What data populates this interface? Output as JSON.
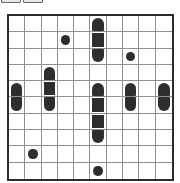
{
  "app": {
    "title": "Battleships Puzzle Grid"
  },
  "toolbar": {
    "buttons": [
      {
        "name": "toolbar-button-1",
        "label": ""
      },
      {
        "name": "toolbar-button-2",
        "label": ""
      }
    ]
  },
  "grid": {
    "columns": 10,
    "rows": 10,
    "border_color": "#2b2b2b",
    "line_color": "#8f8f8f",
    "piece_color": "#2e2e2e",
    "background": "#ffffff",
    "piece_types": {
      "empty": "empty-cell",
      "middle": "ship-middle-square",
      "end-top": "ship-end-rounded-top",
      "end-bottom": "ship-end-rounded-bottom",
      "end-left": "ship-end-rounded-left",
      "end-right": "ship-end-rounded-right",
      "sub": "submarine-circle",
      "water": "water-dot"
    },
    "cells": [
      [
        "",
        "",
        "",
        "",
        "",
        "end-top",
        "",
        "",
        "",
        ""
      ],
      [
        "",
        "",
        "",
        "sub",
        "",
        "middle",
        "",
        "",
        "",
        ""
      ],
      [
        "",
        "",
        "",
        "",
        "",
        "end-bottom",
        "",
        "sub",
        "",
        ""
      ],
      [
        "",
        "",
        "end-top",
        "",
        "",
        "",
        "",
        "",
        "",
        ""
      ],
      [
        "end-top",
        "",
        "middle",
        "",
        "",
        "end-top",
        "",
        "end-top",
        "",
        "end-top"
      ],
      [
        "end-bottom",
        "",
        "end-bottom",
        "",
        "",
        "middle",
        "",
        "end-bottom",
        "",
        "end-bottom"
      ],
      [
        "",
        "",
        "",
        "",
        "",
        "middle",
        "",
        "",
        "",
        ""
      ],
      [
        "",
        "",
        "",
        "",
        "",
        "end-bottom",
        "",
        "",
        "",
        ""
      ],
      [
        "",
        "sub",
        "",
        "",
        "",
        "",
        "",
        "",
        "",
        ""
      ],
      [
        "",
        "",
        "",
        "",
        "",
        "sub",
        "",
        "",
        "",
        ""
      ]
    ]
  }
}
